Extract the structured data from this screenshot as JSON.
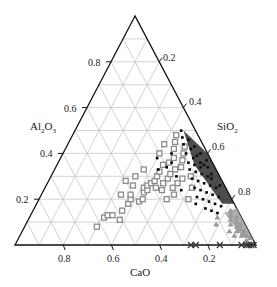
{
  "chart_data": {
    "type": "scatter",
    "subtype": "ternary",
    "title": "",
    "axes": {
      "bottom": {
        "label": "CaO",
        "ticks": [
          "0.8",
          "0.6",
          "0.4",
          "0.2"
        ]
      },
      "left": {
        "label": "Al2O3",
        "label_main": "Al",
        "label_sub1": "2",
        "label_mid": "O",
        "label_sub2": "3",
        "ticks": [
          "0.8",
          "0.6",
          "0.4",
          "0.2"
        ]
      },
      "right": {
        "label": "SiO2",
        "label_main": "SiO",
        "label_sub": "2",
        "ticks": [
          "0.2",
          "0.4",
          "0.6",
          "0.8"
        ]
      }
    },
    "grid": true,
    "grid_step": 0.1,
    "corners": {
      "top": "Al2O3 = 1",
      "bottom_left": "CaO = 1",
      "bottom_right": "SiO2 = 1"
    },
    "series": [
      {
        "name": "gray open squares",
        "marker": "square-open",
        "color": "#8a8a8a",
        "points_cao_al2o3": [
          [
            0.62,
            0.08
          ],
          [
            0.57,
            0.12
          ],
          [
            0.55,
            0.13
          ],
          [
            0.53,
            0.13
          ],
          [
            0.51,
            0.11
          ],
          [
            0.48,
            0.15
          ],
          [
            0.44,
            0.18
          ],
          [
            0.42,
            0.2
          ],
          [
            0.41,
            0.22
          ],
          [
            0.39,
            0.19
          ],
          [
            0.37,
            0.2
          ],
          [
            0.35,
            0.23
          ],
          [
            0.34,
            0.25
          ],
          [
            0.33,
            0.24
          ],
          [
            0.32,
            0.26
          ],
          [
            0.3,
            0.27
          ],
          [
            0.29,
            0.25
          ],
          [
            0.28,
            0.28
          ],
          [
            0.27,
            0.24
          ],
          [
            0.26,
            0.3
          ],
          [
            0.25,
            0.27
          ],
          [
            0.24,
            0.32
          ],
          [
            0.23,
            0.22
          ],
          [
            0.22,
            0.29
          ],
          [
            0.21,
            0.35
          ],
          [
            0.2,
            0.31
          ],
          [
            0.19,
            0.27
          ],
          [
            0.18,
            0.36
          ],
          [
            0.17,
            0.33
          ],
          [
            0.16,
            0.29
          ],
          [
            0.15,
            0.38
          ],
          [
            0.14,
            0.34
          ],
          [
            0.13,
            0.42
          ],
          [
            0.12,
            0.37
          ],
          [
            0.11,
            0.45
          ],
          [
            0.1,
            0.4
          ],
          [
            0.09,
            0.48
          ],
          [
            0.08,
            0.43
          ],
          [
            0.3,
            0.33
          ],
          [
            0.35,
            0.3
          ],
          [
            0.4,
            0.28
          ],
          [
            0.22,
            0.25
          ],
          [
            0.18,
            0.2
          ],
          [
            0.12,
            0.3
          ],
          [
            0.16,
            0.44
          ],
          [
            0.45,
            0.22
          ],
          [
            0.38,
            0.26
          ],
          [
            0.27,
            0.2
          ],
          [
            0.2,
            0.4
          ],
          [
            0.14,
            0.25
          ]
        ]
      },
      {
        "name": "black dots",
        "marker": "dot",
        "color": "#000000",
        "points_cao_al2o3": [
          [
            0.06,
            0.5
          ],
          [
            0.07,
            0.47
          ],
          [
            0.05,
            0.46
          ],
          [
            0.08,
            0.44
          ],
          [
            0.06,
            0.42
          ],
          [
            0.04,
            0.43
          ],
          [
            0.09,
            0.4
          ],
          [
            0.07,
            0.38
          ],
          [
            0.05,
            0.39
          ],
          [
            0.03,
            0.4
          ],
          [
            0.1,
            0.36
          ],
          [
            0.08,
            0.35
          ],
          [
            0.06,
            0.34
          ],
          [
            0.04,
            0.35
          ],
          [
            0.11,
            0.33
          ],
          [
            0.09,
            0.32
          ],
          [
            0.07,
            0.31
          ],
          [
            0.05,
            0.3
          ],
          [
            0.03,
            0.31
          ],
          [
            0.12,
            0.29
          ],
          [
            0.1,
            0.28
          ],
          [
            0.08,
            0.27
          ],
          [
            0.06,
            0.26
          ],
          [
            0.04,
            0.25
          ],
          [
            0.13,
            0.25
          ],
          [
            0.11,
            0.24
          ],
          [
            0.09,
            0.23
          ],
          [
            0.07,
            0.22
          ],
          [
            0.05,
            0.21
          ],
          [
            0.14,
            0.21
          ],
          [
            0.12,
            0.2
          ],
          [
            0.1,
            0.19
          ],
          [
            0.08,
            0.18
          ],
          [
            0.06,
            0.17
          ],
          [
            0.16,
            0.18
          ],
          [
            0.13,
            0.16
          ],
          [
            0.11,
            0.15
          ],
          [
            0.09,
            0.14
          ],
          [
            0.18,
            0.3
          ],
          [
            0.2,
            0.34
          ],
          [
            0.22,
            0.38
          ],
          [
            0.17,
            0.36
          ],
          [
            0.15,
            0.4
          ],
          [
            0.24,
            0.33
          ],
          [
            0.19,
            0.24
          ],
          [
            0.05,
            0.36
          ],
          [
            0.03,
            0.34
          ],
          [
            0.02,
            0.37
          ],
          [
            0.04,
            0.29
          ],
          [
            0.02,
            0.26
          ]
        ]
      },
      {
        "name": "gray triangles",
        "marker": "triangle",
        "color": "#9a9a9a",
        "points_cao_al2o3": [
          [
            0.03,
            0.15
          ],
          [
            0.04,
            0.13
          ],
          [
            0.02,
            0.12
          ],
          [
            0.05,
            0.11
          ],
          [
            0.03,
            0.1
          ],
          [
            0.02,
            0.09
          ],
          [
            0.04,
            0.08
          ],
          [
            0.03,
            0.07
          ],
          [
            0.02,
            0.06
          ],
          [
            0.05,
            0.06
          ],
          [
            0.03,
            0.05
          ],
          [
            0.02,
            0.04
          ],
          [
            0.04,
            0.04
          ],
          [
            0.01,
            0.03
          ],
          [
            0.03,
            0.02
          ],
          [
            0.08,
            0.06
          ],
          [
            0.06,
            0.09
          ],
          [
            0.12,
            0.09
          ],
          [
            0.07,
            0.04
          ],
          [
            0.1,
            0.12
          ]
        ]
      },
      {
        "name": "crosses",
        "marker": "x",
        "color": "#333333",
        "points_cao_al2o3": [
          [
            0.27,
            0.0
          ],
          [
            0.25,
            0.0
          ],
          [
            0.15,
            0.0
          ],
          [
            0.06,
            0.0
          ],
          [
            0.04,
            0.0
          ],
          [
            0.03,
            0.0
          ],
          [
            0.02,
            0.0
          ],
          [
            0.01,
            0.0
          ]
        ]
      }
    ]
  }
}
